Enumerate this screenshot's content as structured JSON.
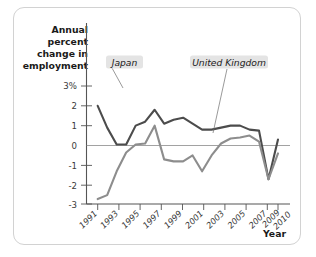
{
  "figure": {
    "year_axis_label": "Year",
    "y_axis_title_lines": [
      "Annual",
      "percent",
      "change in",
      "employment"
    ],
    "colors": {
      "uk_line": "#4c4c4c",
      "japan_line": "#8d8d8d",
      "border": "#d2d2d2",
      "label_box": "#e4e4e4"
    }
  },
  "chart_data": {
    "type": "line",
    "title": "",
    "xlabel": "Year",
    "ylabel": "Annual percent change in employment",
    "grid": false,
    "legend_position": "inline-annotations",
    "xlim": [
      1991,
      2010
    ],
    "ylim": [
      -3,
      3
    ],
    "ytick_labels": [
      "3%",
      "2",
      "1",
      "0",
      "-1",
      "-2",
      "-3"
    ],
    "ytick_values": [
      3,
      2,
      1,
      0,
      -1,
      -2,
      -3
    ],
    "xtick_labels": [
      "1991",
      "1993",
      "1995",
      "1997",
      "1999",
      "2001",
      "2003",
      "2005",
      "2007",
      "2009",
      "2010"
    ],
    "xtick_values": [
      1991,
      1993,
      1995,
      1997,
      1999,
      2001,
      2003,
      2005,
      2007,
      2009,
      2010
    ],
    "x": [
      1991,
      1992,
      1993,
      1994,
      1995,
      1996,
      1997,
      1998,
      1999,
      2000,
      2001,
      2002,
      2003,
      2004,
      2005,
      2006,
      2007,
      2008,
      2009,
      2010
    ],
    "series": [
      {
        "name": "United Kingdom",
        "color": "#4c4c4c",
        "values": [
          2.0,
          0.9,
          0.05,
          0.05,
          1.0,
          1.2,
          1.8,
          1.1,
          1.3,
          1.4,
          1.1,
          0.8,
          0.8,
          0.9,
          1.0,
          1.0,
          0.8,
          0.75,
          -1.7,
          0.3
        ]
      },
      {
        "name": "Japan",
        "color": "#8d8d8d",
        "values": [
          -2.7,
          -2.5,
          -1.3,
          -0.35,
          0.05,
          0.1,
          1.0,
          -0.7,
          -0.8,
          -0.8,
          -0.5,
          -1.3,
          -0.5,
          0.1,
          0.35,
          0.4,
          0.5,
          0.2,
          -1.7,
          -0.4
        ]
      }
    ],
    "annotations": [
      {
        "text": "Japan",
        "series": "Japan",
        "points_to_year": 1993
      },
      {
        "text": "United Kingdom",
        "series": "United Kingdom",
        "points_to_year": 2002
      }
    ]
  }
}
